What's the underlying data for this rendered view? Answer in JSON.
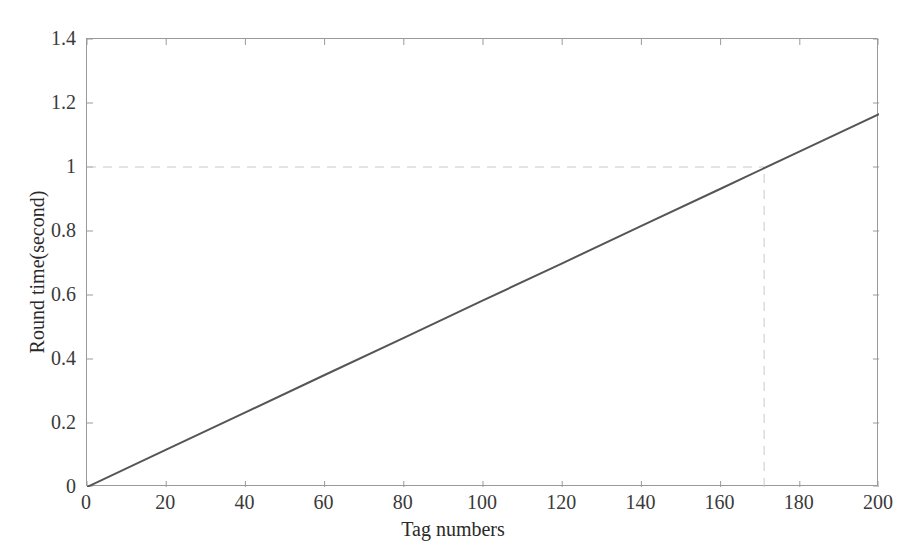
{
  "chart_data": {
    "type": "line",
    "title": "",
    "subtitle": "",
    "xlabel": "Tag numbers",
    "ylabel": "Round time(second)",
    "xlim": [
      0,
      200
    ],
    "ylim": [
      0,
      1.4
    ],
    "xticks": [
      0,
      20,
      40,
      60,
      80,
      100,
      120,
      140,
      160,
      180,
      200
    ],
    "yticks": [
      0,
      0.2,
      0.4,
      0.6,
      0.8,
      1,
      1.2,
      1.4
    ],
    "xtick_labels": [
      "0",
      "20",
      "40",
      "60",
      "80",
      "100",
      "120",
      "140",
      "160",
      "180",
      "200"
    ],
    "ytick_labels": [
      "0",
      "0.2",
      "0.4",
      "0.6",
      "0.8",
      "1",
      "1.2",
      "1.4"
    ],
    "grid": false,
    "legend": null,
    "legend_position": "none",
    "series": [
      {
        "name": "Round time",
        "color": "#555555",
        "style": "solid",
        "x": [
          0,
          20,
          40,
          60,
          80,
          100,
          120,
          140,
          160,
          180,
          200
        ],
        "values": [
          0,
          0.117,
          0.233,
          0.35,
          0.466,
          0.583,
          0.699,
          0.816,
          0.932,
          1.049,
          1.165
        ]
      }
    ],
    "annotations": [
      {
        "name": "threshold-line-horizontal",
        "type": "hline",
        "y": 1,
        "x_start": 0,
        "x_end": 171,
        "style": "dashed",
        "color": "#c8c8c8"
      },
      {
        "name": "threshold-line-vertical",
        "type": "vline",
        "x": 171,
        "y_start": 0,
        "y_end": 1,
        "style": "dashed",
        "color": "#c8c8c8"
      }
    ],
    "axis_color": "#9a9a9a",
    "text_color": "#2a2a2a"
  }
}
